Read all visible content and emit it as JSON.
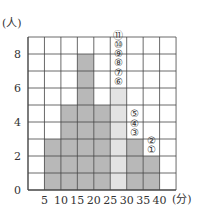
{
  "chart_data": {
    "type": "bar",
    "subtype": "histogram",
    "title": "",
    "xlabel": "(分)",
    "ylabel": "(人)",
    "x_ticks": [
      "5",
      "10",
      "15",
      "20",
      "25",
      "30",
      "35",
      "40"
    ],
    "y_ticks": [
      "0",
      "2",
      "4",
      "6",
      "8"
    ],
    "ylim": [
      0,
      9
    ],
    "xlim": [
      0,
      45
    ],
    "grid": true,
    "bins": [
      {
        "from": 0,
        "to": 5,
        "value": 0,
        "style": "none"
      },
      {
        "from": 5,
        "to": 10,
        "value": 3,
        "style": "dark"
      },
      {
        "from": 10,
        "to": 15,
        "value": 5,
        "style": "dark"
      },
      {
        "from": 15,
        "to": 20,
        "value": 8,
        "style": "dark"
      },
      {
        "from": 20,
        "to": 25,
        "value": 5,
        "style": "dark"
      },
      {
        "from": 25,
        "to": 30,
        "value": 6,
        "style": "light"
      },
      {
        "from": 30,
        "to": 35,
        "value": 3,
        "style": "dark"
      },
      {
        "from": 35,
        "to": 40,
        "value": 2,
        "style": "dark"
      }
    ],
    "annotations": [
      {
        "bin": "35-40",
        "labels": [
          "①",
          "②"
        ],
        "start_row": 2
      },
      {
        "bin": "30-35",
        "labels": [
          "③",
          "④",
          "⑤"
        ],
        "start_row": 3
      },
      {
        "bin": "25-30",
        "labels": [
          "⑥",
          "⑦",
          "⑧",
          "⑨",
          "⑩",
          "⑪"
        ],
        "start_row": 6,
        "faded": [
          "⑨"
        ]
      }
    ],
    "colors": {
      "dark": "#b8b8b8",
      "light": "#e3e3e3",
      "grid": "#444444",
      "faded_label": "#bbbbbb"
    }
  }
}
